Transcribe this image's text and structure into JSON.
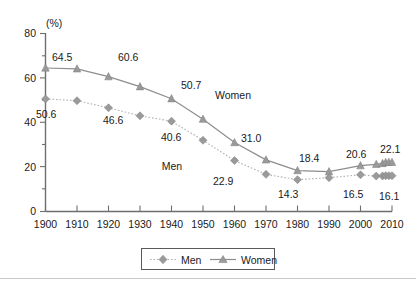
{
  "chart_data": {
    "type": "line",
    "title": "",
    "subtitle": "",
    "xlabel": "",
    "ylabel": "",
    "unit_label": "(%)",
    "xlim": [
      1900,
      2010
    ],
    "ylim": [
      0,
      80
    ],
    "grid": false,
    "legend_position": "bottom-center",
    "x_tick_labels": [
      "1900",
      "1910",
      "1920",
      "1930",
      "1940",
      "1950",
      "1960",
      "1970",
      "1980",
      "1990",
      "2000",
      "2010"
    ],
    "x_ticks": [
      1900,
      1910,
      1920,
      1930,
      1940,
      1950,
      1960,
      1970,
      1980,
      1990,
      2000,
      2010
    ],
    "y_tick_labels": [
      "0",
      "20",
      "40",
      "60",
      "80"
    ],
    "y_ticks": [
      0,
      20,
      40,
      60,
      80
    ],
    "y_minor_ticks": [
      10,
      30,
      50,
      70
    ],
    "series": [
      {
        "name": "Men",
        "marker": "diamond",
        "line_style": "dotted",
        "color": "#9a9a9a",
        "x": [
          1900,
          1910,
          1920,
          1930,
          1940,
          1950,
          1960,
          1970,
          1980,
          1990,
          2000,
          2005,
          2007,
          2008,
          2009,
          2010
        ],
        "values": [
          50.6,
          49.8,
          46.6,
          43.0,
          40.6,
          32.0,
          22.9,
          16.7,
          14.3,
          15.2,
          16.5,
          15.9,
          16.0,
          16.1,
          16.1,
          16.1
        ]
      },
      {
        "name": "Women",
        "marker": "triangle",
        "line_style": "solid",
        "color": "#8d8d8d",
        "x": [
          1900,
          1910,
          1920,
          1930,
          1940,
          1950,
          1960,
          1970,
          1980,
          1990,
          2000,
          2005,
          2007,
          2008,
          2009,
          2010
        ],
        "values": [
          64.5,
          64.1,
          60.6,
          56.1,
          50.7,
          41.5,
          31.0,
          23.2,
          18.4,
          17.9,
          20.6,
          21.2,
          21.6,
          22.1,
          22.1,
          22.1
        ]
      }
    ],
    "point_labels": [
      {
        "series": "Women",
        "x": 1900,
        "text": "64.5"
      },
      {
        "series": "Women",
        "x": 1920,
        "text": "60.6"
      },
      {
        "series": "Women",
        "x": 1940,
        "text": "50.7"
      },
      {
        "series": "Women",
        "x": 1960,
        "text": "31.0"
      },
      {
        "series": "Women",
        "x": 1980,
        "text": "18.4"
      },
      {
        "series": "Women",
        "x": 2000,
        "text": "20.6"
      },
      {
        "series": "Women",
        "x": 2010,
        "text": "22.1"
      },
      {
        "series": "Men",
        "x": 1900,
        "text": "50.6"
      },
      {
        "series": "Men",
        "x": 1920,
        "text": "46.6"
      },
      {
        "series": "Men",
        "x": 1940,
        "text": "40.6"
      },
      {
        "series": "Men",
        "x": 1960,
        "text": "22.9"
      },
      {
        "series": "Men",
        "x": 1980,
        "text": "14.3"
      },
      {
        "series": "Men",
        "x": 2000,
        "text": "16.5"
      },
      {
        "series": "Men",
        "x": 2010,
        "text": "16.1"
      }
    ],
    "annotations": [
      {
        "text": "Women",
        "x": 1966,
        "y": 48
      },
      {
        "text": "Men",
        "x": 1942,
        "y": 25
      }
    ],
    "legend_entries": [
      "Men",
      "Women"
    ]
  },
  "labels": {
    "unit": "(%)",
    "x": {
      "t1900": "1900",
      "t1910": "1910",
      "t1920": "1920",
      "t1930": "1930",
      "t1940": "1940",
      "t1950": "1950",
      "t1960": "1960",
      "t1970": "1970",
      "t1980": "1980",
      "t1990": "1990",
      "t2000": "2000",
      "t2010": "2010"
    },
    "y": {
      "y0": "0",
      "y20": "20",
      "y40": "40",
      "y60": "60",
      "y80": "80"
    },
    "values": {
      "w1900": "64.5",
      "w1920": "60.6",
      "w1940": "50.7",
      "w1960": "31.0",
      "w1980": "18.4",
      "w2000": "20.6",
      "w2010": "22.1",
      "m1900": "50.6",
      "m1920": "46.6",
      "m1940": "40.6",
      "m1960": "22.9",
      "m1980": "14.3",
      "m2000": "16.5",
      "m2010": "16.1"
    },
    "annotations": {
      "women": "Women",
      "men": "Men"
    },
    "legend": {
      "men": "Men",
      "women": "Women"
    }
  },
  "colors": {
    "men": "#9a9a9a",
    "women": "#8d8d8d",
    "axis": "#6e6e6e",
    "text": "#1a1a1a",
    "background": "#ffffff"
  }
}
